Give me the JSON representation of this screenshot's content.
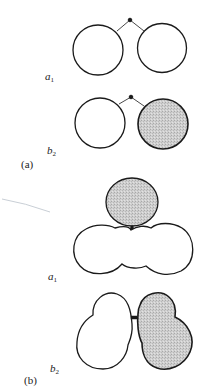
{
  "figure": {
    "panels": [
      {
        "label": "(a)",
        "diagrams": [
          {
            "state_letter": "a",
            "state_index": "1",
            "description": "two unshaded circles joined by bonds to a central atom"
          },
          {
            "state_letter": "b",
            "state_index": "2",
            "description": "left circle unshaded, right circle shaded, joined by bonds to a central atom"
          }
        ]
      },
      {
        "label": "(b)",
        "diagrams": [
          {
            "state_letter": "a",
            "state_index": "1",
            "description": "shaded lobe above an unshaded three-lobed cloud"
          },
          {
            "state_letter": "b",
            "state_index": "2",
            "description": "unshaded two-lobed shape beside a shaded two-lobed shape"
          }
        ]
      }
    ],
    "colors": {
      "stroke": "#1a1a1a",
      "shaded_fill": "#c8c8c8",
      "unshaded_fill": "#ffffff",
      "stray_mark": "#c9cfd6"
    }
  }
}
